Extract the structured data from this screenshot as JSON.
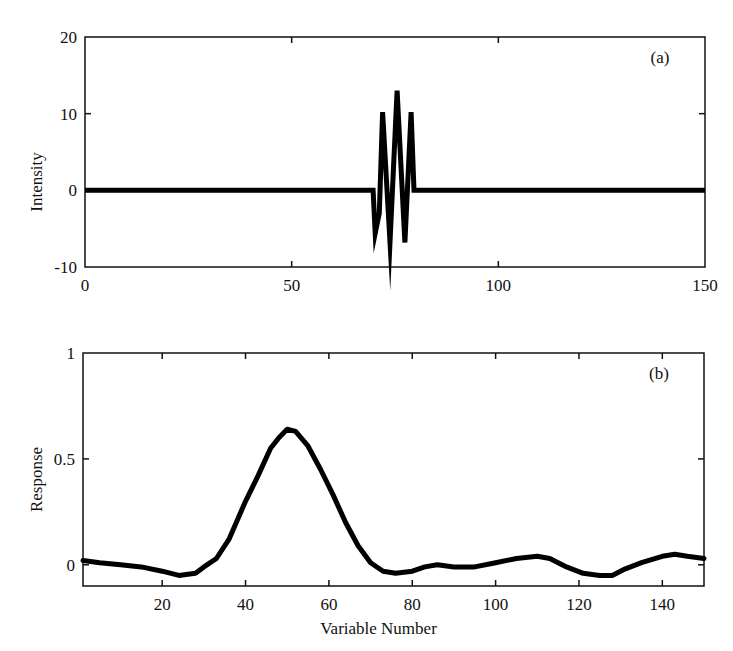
{
  "chart_data": [
    {
      "type": "line",
      "panel_label": "(a)",
      "title": "",
      "xlabel": "",
      "ylabel": "Intensity",
      "xlim": [
        0,
        150
      ],
      "ylim": [
        -10,
        20
      ],
      "xticks": [
        0,
        50,
        100,
        150
      ],
      "yticks": [
        -10,
        0,
        10,
        20
      ],
      "xtick_labels": [
        "0",
        "50",
        "100",
        "150"
      ],
      "ytick_labels": [
        "-10",
        "0",
        "10",
        "20"
      ],
      "grid": false,
      "legend": null,
      "series": [
        {
          "name": "intensity",
          "x": [
            0,
            69.7,
            70.2,
            71.2,
            72.0,
            73.8,
            75.5,
            77.4,
            78.9,
            79.6,
            150
          ],
          "y": [
            0,
            0,
            -5.6,
            -3.0,
            10.2,
            -6.8,
            13.0,
            -6.8,
            10.2,
            0,
            0
          ]
        }
      ]
    },
    {
      "type": "line",
      "panel_label": "(b)",
      "title": "",
      "xlabel": "Variable Number",
      "ylabel": "Response",
      "xlim": [
        1,
        150
      ],
      "ylim": [
        -0.1,
        1
      ],
      "xticks": [
        20,
        40,
        60,
        80,
        100,
        120,
        140
      ],
      "yticks": [
        0,
        0.5,
        1
      ],
      "xtick_labels": [
        "20",
        "40",
        "60",
        "80",
        "100",
        "120",
        "140"
      ],
      "ytick_labels": [
        "0",
        "0.5",
        "1"
      ],
      "grid": false,
      "legend": null,
      "series": [
        {
          "name": "response",
          "x": [
            1,
            5,
            10,
            15,
            20,
            24,
            28,
            30,
            33,
            36,
            40,
            43,
            46,
            48,
            50,
            52,
            55,
            58,
            61,
            64,
            67,
            70,
            73,
            76,
            80,
            83,
            86,
            90,
            95,
            100,
            105,
            110,
            113,
            117,
            121,
            125,
            128,
            131,
            135,
            140,
            143,
            146,
            150
          ],
          "y": [
            0.02,
            0.01,
            0.0,
            -0.01,
            -0.03,
            -0.05,
            -0.04,
            -0.01,
            0.03,
            0.12,
            0.3,
            0.42,
            0.55,
            0.6,
            0.64,
            0.63,
            0.56,
            0.45,
            0.33,
            0.2,
            0.09,
            0.01,
            -0.03,
            -0.04,
            -0.03,
            -0.01,
            0.0,
            -0.01,
            -0.01,
            0.01,
            0.03,
            0.04,
            0.03,
            -0.01,
            -0.04,
            -0.05,
            -0.05,
            -0.02,
            0.01,
            0.04,
            0.05,
            0.04,
            0.03
          ]
        }
      ]
    }
  ],
  "style": {
    "line_color": "#000000",
    "axis_color": "#111111",
    "background": "#ffffff"
  }
}
